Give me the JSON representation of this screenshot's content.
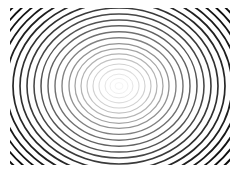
{
  "figure": {
    "title": "Concentric Ring Pattern",
    "kind": "concentric-rings",
    "background_color": "#ffffff",
    "canvas_width": 240,
    "canvas_height": 173,
    "center_x": 119,
    "center_y": 86,
    "clip": {
      "left": 10,
      "top": 8,
      "right": 230,
      "bottom": 165
    },
    "stroke_color_inner": "#f2f2f2",
    "stroke_color_outer": "#111111",
    "ring_count": 22,
    "aspect_ratio": 1.18
  },
  "chart_data": {
    "type": "scatter",
    "title": "Concentric Ring Pattern",
    "xlabel": "",
    "ylabel": "",
    "xlim": [
      0,
      240
    ],
    "ylim": [
      0,
      173
    ],
    "grid": false,
    "legend": "none",
    "center": [
      119,
      86
    ],
    "series": [
      {
        "name": "rings",
        "description": "radius_x, radius_y and stroke gray level per ring, ordered inner to outer",
        "radius_x": [
          4,
          9,
          14,
          20,
          26,
          32,
          38,
          44,
          50,
          57,
          64,
          71,
          78,
          85,
          92,
          99,
          106,
          113,
          120,
          127,
          134,
          141
        ],
        "radius_y": [
          3.4,
          7.6,
          11.9,
          16.9,
          22.0,
          27.1,
          32.2,
          37.3,
          42.4,
          48.3,
          54.2,
          60.2,
          66.1,
          72.0,
          78.0,
          83.9,
          89.8,
          95.8,
          101.7,
          107.6,
          113.6,
          119.5
        ],
        "stroke_gray": [
          "#f4f4f4",
          "#eeeeee",
          "#e6e6e6",
          "#dcdcdc",
          "#d0d0d0",
          "#c2c2c2",
          "#b3b3b3",
          "#a3a3a3",
          "#929292",
          "#818181",
          "#707070",
          "#616161",
          "#535353",
          "#464646",
          "#3a3a3a",
          "#303030",
          "#272727",
          "#1f1f1f",
          "#191919",
          "#141414",
          "#101010",
          "#0d0d0d"
        ],
        "stroke_width": [
          0.9,
          0.95,
          1.0,
          1.05,
          1.1,
          1.15,
          1.2,
          1.25,
          1.3,
          1.35,
          1.4,
          1.45,
          1.5,
          1.55,
          1.6,
          1.65,
          1.7,
          1.75,
          1.8,
          1.85,
          1.9,
          1.95
        ]
      }
    ]
  }
}
